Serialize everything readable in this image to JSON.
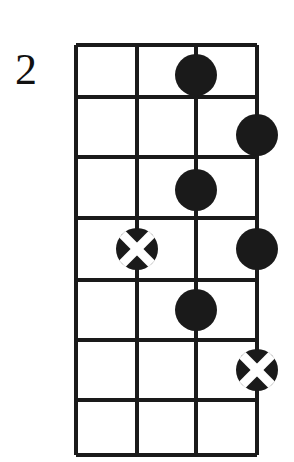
{
  "diagram": {
    "type": "guitar-chord-fretboard-diagram",
    "title": "",
    "fret_number_label": "2",
    "orientation": "vertical",
    "strings_count": 4,
    "frets_count": 7,
    "colors": {
      "background": "#ffffff",
      "grid_line": "#1a1a1a",
      "marker_fill": "#1a1a1a",
      "marker_cross": "#ffffff"
    },
    "geometry": {
      "grid_left": 76,
      "grid_right": 257,
      "grid_top": 45,
      "grid_bottom": 455,
      "string_x": [
        76,
        137,
        196,
        257
      ],
      "fret_y": [
        45,
        97,
        157,
        218,
        280,
        340,
        400,
        455
      ],
      "grid_stroke_width": 4,
      "marker_radius": 21,
      "cross_stroke_width": 9
    },
    "markers": [
      {
        "name": "marker-dot-string3-fret1",
        "shape": "filled-circle",
        "string": 3,
        "fret": 1,
        "cx": 196,
        "cy": 75
      },
      {
        "name": "marker-dot-string4-fret2",
        "shape": "filled-circle",
        "string": 4,
        "fret": 2,
        "cx": 257,
        "cy": 135
      },
      {
        "name": "marker-dot-string3-fret3",
        "shape": "filled-circle",
        "string": 3,
        "fret": 3,
        "cx": 196,
        "cy": 190
      },
      {
        "name": "marker-cross-string2-fret4",
        "shape": "cross-circle",
        "string": 2,
        "fret": 4,
        "cx": 137,
        "cy": 249
      },
      {
        "name": "marker-dot-string4-fret4",
        "shape": "filled-circle",
        "string": 4,
        "fret": 4,
        "cx": 257,
        "cy": 249
      },
      {
        "name": "marker-dot-string3-fret5",
        "shape": "filled-circle",
        "string": 3,
        "fret": 5,
        "cx": 196,
        "cy": 310
      },
      {
        "name": "marker-cross-string4-fret6",
        "shape": "cross-circle",
        "string": 4,
        "fret": 6,
        "cx": 257,
        "cy": 370
      }
    ]
  }
}
